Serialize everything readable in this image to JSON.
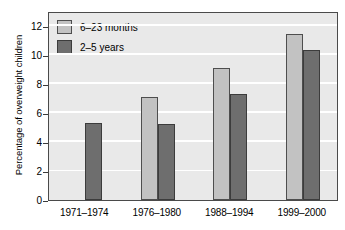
{
  "chart_data": {
    "type": "bar",
    "title": "",
    "xlabel": "",
    "ylabel": "Percentage of overweight children",
    "ylim": [
      0,
      13
    ],
    "ytick_values": [
      0,
      2,
      4,
      6,
      8,
      10,
      12
    ],
    "ytick_labels": [
      "0",
      "2",
      "4",
      "6",
      "8",
      "10",
      "12"
    ],
    "grid": true,
    "grid_color": "#ffffff",
    "legend_position": "top-left",
    "plot_background": "#e9e9e9",
    "categories": [
      "1971–1974",
      "1976–1980",
      "1988–1994",
      "1999–2000"
    ],
    "series": [
      {
        "name": "6–23 months",
        "color": "#c2c2c2",
        "values": [
          null,
          7.1,
          9.1,
          11.4
        ]
      },
      {
        "name": "2–5 years",
        "color": "#6e6e6e",
        "values": [
          5.3,
          5.25,
          7.3,
          10.3
        ]
      }
    ]
  },
  "legend": {
    "items": [
      {
        "label": "6–23 months",
        "swatch": "light-gray-swatch"
      },
      {
        "label": "2–5 years",
        "swatch": "dark-gray-swatch"
      }
    ]
  }
}
